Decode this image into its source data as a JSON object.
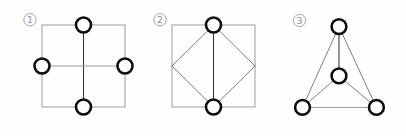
{
  "canvas": {
    "width": 406,
    "height": 136,
    "background": "#fefefe"
  },
  "style": {
    "node_stroke": "#0d0d0d",
    "node_fill": "#ffffff",
    "node_stroke_width": 2.6,
    "node_radius": 7.5,
    "frame_stroke": "#9b9b9b",
    "frame_stroke_width": 1.0,
    "edge_stroke": "#6e6e6e",
    "edge_stroke_width": 0.9,
    "spine_stroke": "#3a3a3a",
    "spine_stroke_width": 1.1,
    "label_color": "#8d8d8d"
  },
  "figures": [
    {
      "id": "figure-1",
      "label": "①",
      "label_text": "1",
      "caption": "square with four midpoint nodes and a cross",
      "label_pos": {
        "x": 30,
        "y": 23
      },
      "frame": {
        "shape": "square",
        "x": 42,
        "y": 25,
        "width": 83,
        "height": 82
      },
      "edges": [
        {
          "name": "vertical-spine",
          "x1": 83.5,
          "y1": 25,
          "x2": 83.5,
          "y2": 107,
          "kind": "spine"
        },
        {
          "name": "horizontal-spine",
          "x1": 42,
          "y1": 66,
          "x2": 125,
          "y2": 66,
          "kind": "light"
        }
      ],
      "nodes": [
        {
          "name": "node-top",
          "x": 83.5,
          "y": 25
        },
        {
          "name": "node-left",
          "x": 42,
          "y": 66
        },
        {
          "name": "node-right",
          "x": 125,
          "y": 66
        },
        {
          "name": "node-bottom",
          "x": 83.5,
          "y": 107
        }
      ]
    },
    {
      "id": "figure-2",
      "label": "②",
      "label_text": "2",
      "caption": "square with inscribed diamond and two nodes",
      "label_pos": {
        "x": 24,
        "y": 23
      },
      "frame": {
        "shape": "square",
        "x": 36,
        "y": 25,
        "width": 83,
        "height": 82
      },
      "edges": [
        {
          "name": "diamond-top-left",
          "x1": 77.5,
          "y1": 25,
          "x2": 36,
          "y2": 66,
          "kind": "edge"
        },
        {
          "name": "diamond-top-right",
          "x1": 77.5,
          "y1": 25,
          "x2": 119,
          "y2": 66,
          "kind": "edge"
        },
        {
          "name": "diamond-bottom-left",
          "x1": 36,
          "y1": 66,
          "x2": 77.5,
          "y2": 107,
          "kind": "edge"
        },
        {
          "name": "diamond-bottom-right",
          "x1": 119,
          "y1": 66,
          "x2": 77.5,
          "y2": 107,
          "kind": "edge"
        },
        {
          "name": "vertical-spine",
          "x1": 77.5,
          "y1": 25,
          "x2": 77.5,
          "y2": 107,
          "kind": "spine"
        }
      ],
      "nodes": [
        {
          "name": "node-top",
          "x": 77.5,
          "y": 25
        },
        {
          "name": "node-bottom",
          "x": 77.5,
          "y": 107
        }
      ]
    },
    {
      "id": "figure-3",
      "label": "③",
      "label_text": "3",
      "caption": "triangle with three vertex nodes and a center node",
      "label_pos": {
        "x": 32,
        "y": 23
      },
      "frame": null,
      "edges": [
        {
          "name": "triangle-left-side",
          "x1": 72,
          "y1": 26,
          "x2": 35,
          "y2": 108,
          "kind": "edge"
        },
        {
          "name": "triangle-right-side",
          "x1": 72,
          "y1": 26,
          "x2": 110,
          "y2": 108,
          "kind": "edge"
        },
        {
          "name": "triangle-base",
          "x1": 35,
          "y1": 108,
          "x2": 110,
          "y2": 108,
          "kind": "light"
        },
        {
          "name": "apex-to-center",
          "x1": 72,
          "y1": 26,
          "x2": 72,
          "y2": 76,
          "kind": "spine"
        },
        {
          "name": "center-to-bottom-left",
          "x1": 72,
          "y1": 76,
          "x2": 35,
          "y2": 108,
          "kind": "edge"
        },
        {
          "name": "center-to-bottom-right",
          "x1": 72,
          "y1": 76,
          "x2": 110,
          "y2": 108,
          "kind": "edge"
        }
      ],
      "nodes": [
        {
          "name": "node-apex",
          "x": 72,
          "y": 26
        },
        {
          "name": "node-center",
          "x": 72,
          "y": 76
        },
        {
          "name": "node-bottom-left",
          "x": 35,
          "y": 108
        },
        {
          "name": "node-bottom-right",
          "x": 110,
          "y": 108
        }
      ]
    }
  ]
}
